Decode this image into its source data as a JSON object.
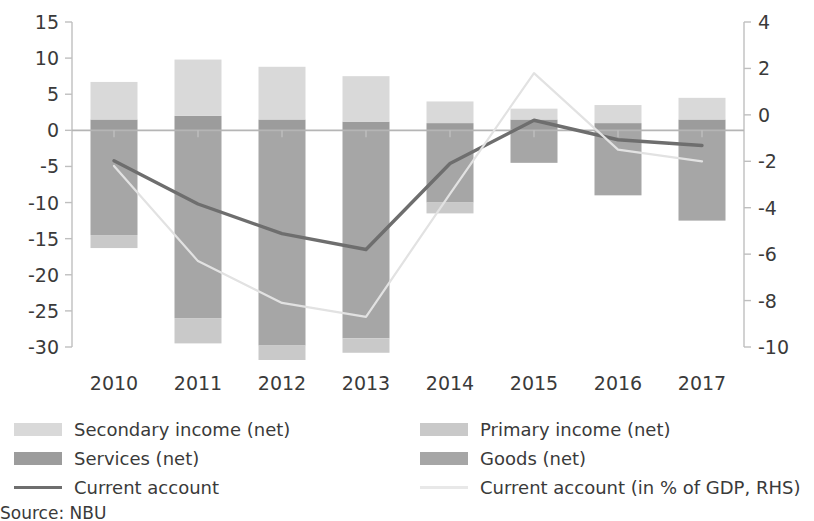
{
  "chart_data": {
    "type": "bar",
    "title": "",
    "subtitle": "",
    "xlabel": "",
    "ylabel": "",
    "y2label": "",
    "grid": false,
    "legend_position": "bottom",
    "categories": [
      "2010",
      "2011",
      "2012",
      "2013",
      "2014",
      "2015",
      "2016",
      "2017"
    ],
    "ylim": [
      -30,
      15
    ],
    "yticks": [
      "15",
      "10",
      "5",
      "0",
      "-5",
      "-10",
      "-15",
      "-20",
      "-25",
      "-30"
    ],
    "ylim_right": [
      -10,
      4
    ],
    "yticks_right": [
      "4",
      "2",
      "0",
      "-2",
      "-4",
      "-6",
      "-8",
      "-10"
    ],
    "series": [
      {
        "name": "Goods (net)",
        "type": "bar-stack",
        "color": "#a6a6a6",
        "values": [
          -14.5,
          -26.0,
          -29.8,
          -28.8,
          -10.0,
          -4.5,
          -9.0,
          -12.5
        ]
      },
      {
        "name": "Services (net)",
        "type": "bar-stack",
        "color": "#9c9c9c",
        "values": [
          1.5,
          2.0,
          1.5,
          1.2,
          1.0,
          1.5,
          1.0,
          1.5
        ]
      },
      {
        "name": "Primary income (net)",
        "type": "bar-stack",
        "color": "#c9c9c9",
        "values": [
          -1.8,
          -3.5,
          -2.0,
          -2.0,
          -1.5,
          0.0,
          0.0,
          0.0
        ]
      },
      {
        "name": "Secondary income (net)",
        "type": "bar-stack",
        "color": "#d9d9d9",
        "values": [
          5.2,
          7.8,
          7.3,
          6.3,
          3.0,
          1.5,
          2.5,
          3.0
        ]
      },
      {
        "name": "Current account",
        "type": "line",
        "axis": "left",
        "color": "#6e6e6e",
        "values": [
          -4.2,
          -10.2,
          -14.3,
          -16.5,
          -4.6,
          1.4,
          -1.3,
          -2.1
        ]
      },
      {
        "name": "Current account (in % of GDP, RHS)",
        "type": "line",
        "axis": "right",
        "color": "#e2e2e2",
        "values": [
          -2.2,
          -6.3,
          -8.1,
          -8.7,
          -3.4,
          1.8,
          -1.5,
          -2.0
        ]
      }
    ]
  },
  "legend": {
    "column_left": [
      {
        "label": "Secondary income (net)",
        "marker": "swatch",
        "color": "#d9d9d9"
      },
      {
        "label": "Services (net)",
        "marker": "swatch",
        "color": "#9c9c9c"
      },
      {
        "label": "Current account",
        "marker": "line",
        "color": "#6e6e6e"
      }
    ],
    "column_right": [
      {
        "label": "Primary income (net)",
        "marker": "swatch",
        "color": "#c9c9c9"
      },
      {
        "label": "Goods (net)",
        "marker": "swatch",
        "color": "#a6a6a6"
      },
      {
        "label": "Current account (in % of GDP, RHS)",
        "marker": "line",
        "color": "#e8e8e8"
      }
    ]
  },
  "footer": {
    "source": "Source: NBU"
  },
  "colors": {
    "axis": "#bfbfbf",
    "zero_line": "#b5b5b5",
    "text": "#3a3a3a",
    "background": "#ffffff"
  }
}
